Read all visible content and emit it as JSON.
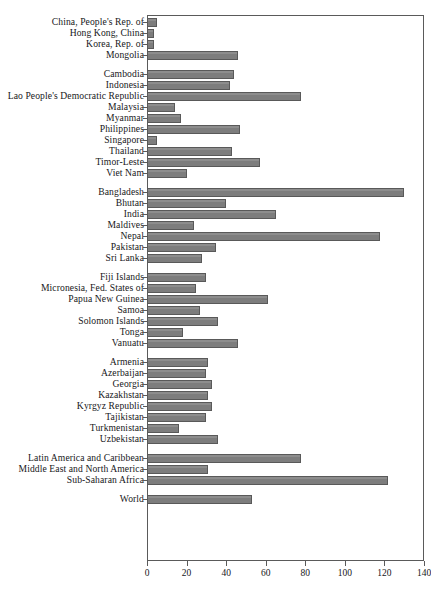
{
  "chart_data": {
    "type": "bar",
    "orientation": "horizontal",
    "title": "",
    "xlabel": "",
    "ylabel": "",
    "xlim": [
      0,
      140
    ],
    "xticks": [
      0,
      20,
      40,
      60,
      80,
      100,
      120,
      140
    ],
    "xtick_labels": [
      "0",
      "20",
      "40",
      "60",
      "80",
      "100",
      "120",
      "140"
    ],
    "grid": false,
    "legend": null,
    "bar_color": "#7d7d7d",
    "bar_edge_color": "#595959",
    "frame_color": "#5a5a5a",
    "groups": [
      {
        "name": "East Asia",
        "categories": [
          "China, People's Rep. of",
          "Hong Kong, China",
          "Korea, Rep. of",
          "Mongolia"
        ],
        "values": [
          5,
          3.5,
          3.5,
          46
        ]
      },
      {
        "name": "Southeast Asia",
        "categories": [
          "Cambodia",
          "Indonesia",
          "Lao People's Democratic Republic",
          "Malaysia",
          "Myanmar",
          "Indonesia-placeholder"
        ],
        "values": []
      }
    ],
    "categories": [
      "China, People's Rep. of",
      "Hong Kong, China",
      "Korea, Rep. of",
      "Mongolia",
      "Cambodia",
      "Indonesia",
      "Lao People's Democratic Republic",
      "Malaysia",
      "Myanmar",
      "Philippines",
      "Singapore",
      "Thailand",
      "Timor-Leste",
      "Viet Nam",
      "Bangladesh",
      "Bhutan",
      "India",
      "Maldives",
      "Nepal",
      "Pakistan",
      "Sri Lanka",
      "Fiji Islands",
      "Micronesia, Fed. States of",
      "Papua New Guinea",
      "Samoa",
      "Solomon Islands",
      "Tonga",
      "Vanuatu",
      "Armenia",
      "Azerbaijan",
      "Georgia",
      "Kazakhstan",
      "Kyrgyz Republic",
      "Tajikistan",
      "Turkmenistan",
      "Uzbekistan",
      "Latin America and Caribbean",
      "Middle East and North America",
      "Sub-Saharan Africa",
      "World"
    ],
    "values": [
      5,
      3.5,
      3.5,
      46,
      44,
      42,
      78,
      14,
      17,
      47,
      5,
      43,
      57,
      20,
      130,
      40,
      65,
      24,
      118,
      35,
      28,
      30,
      25,
      61,
      27,
      36,
      18,
      46,
      31,
      30,
      33,
      31,
      33,
      30,
      16,
      36,
      78,
      31,
      122,
      53
    ],
    "series": [
      {
        "name": "value",
        "values": [
          5,
          3.5,
          3.5,
          46,
          44,
          42,
          78,
          14,
          17,
          47,
          5,
          43,
          57,
          20,
          130,
          40,
          65,
          24,
          118,
          35,
          28,
          30,
          25,
          61,
          27,
          36,
          18,
          46,
          31,
          30,
          33,
          31,
          33,
          30,
          16,
          36,
          78,
          31,
          122,
          53
        ]
      }
    ],
    "group_breaks_after": [
      3,
      13,
      20,
      27,
      35,
      38
    ]
  }
}
